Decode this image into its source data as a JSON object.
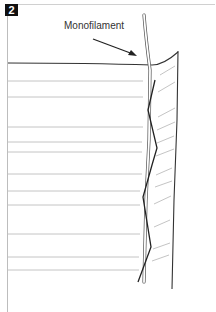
{
  "figure": {
    "step_number": "2",
    "callout_label": "Monofilament",
    "colors": {
      "outline": "#333333",
      "ruled_lines": "#b5b5b5",
      "monofilament_fill": "#ffffff",
      "zigzag": "#222222",
      "badge_bg": "#111111",
      "badge_text": "#ffffff"
    }
  }
}
